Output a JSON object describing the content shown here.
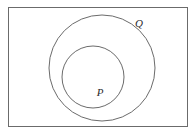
{
  "diagram": {
    "type": "venn-subset",
    "background_color": "#ffffff",
    "stroke_color": "#6b6b6b",
    "label_color": "#2b2b2b",
    "universe": {
      "name": "universal-set-rectangle",
      "x": 8,
      "y": 7,
      "width": 180,
      "height": 120,
      "stroke_width": 1
    },
    "sets": [
      {
        "id": "Q",
        "label": "Q",
        "name": "outer-circle-q",
        "cx": 102,
        "cy": 68,
        "r": 53,
        "stroke_width": 1,
        "label_x": 139,
        "label_y": 24
      },
      {
        "id": "P",
        "label": "P",
        "name": "inner-circle-p",
        "cx": 93,
        "cy": 77,
        "r": 31,
        "stroke_width": 1,
        "label_x": 100,
        "label_y": 93
      }
    ]
  }
}
